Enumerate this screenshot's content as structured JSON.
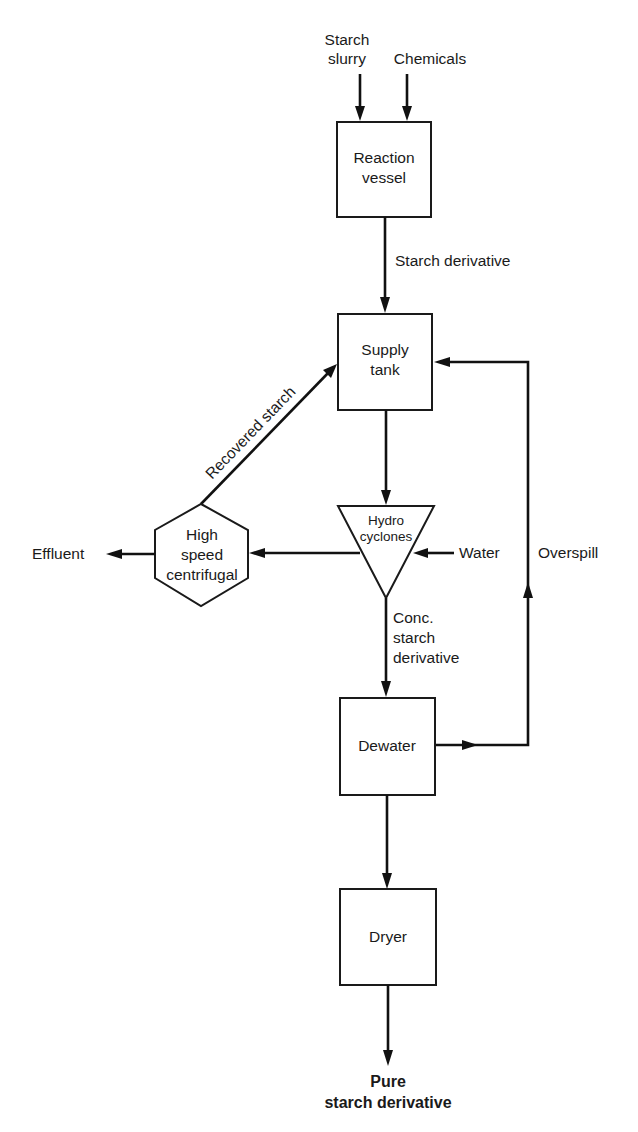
{
  "diagram": {
    "type": "process flow diagram",
    "nodes": {
      "reaction_vessel": {
        "line1": "Reaction",
        "line2": "vessel",
        "shape": "rectangle"
      },
      "supply_tank": {
        "line1": "Supply",
        "line2": "tank",
        "shape": "rectangle"
      },
      "hydrocyclones": {
        "line1": "Hydro",
        "line2": "cyclones",
        "shape": "inverted-triangle"
      },
      "centrifugal": {
        "line1": "High",
        "line2": "speed",
        "line3": "centrifugal",
        "shape": "hexagon"
      },
      "dewater": {
        "label": "Dewater",
        "shape": "rectangle"
      },
      "dryer": {
        "label": "Dryer",
        "shape": "rectangle"
      }
    },
    "inputs": {
      "starch_slurry": {
        "line1": "Starch",
        "line2": "slurry"
      },
      "chemicals": "Chemicals",
      "water": "Water"
    },
    "flows": {
      "starch_derivative": "Starch derivative",
      "recovered_starch": "Recovered starch",
      "conc_line1": "Conc.",
      "conc_line2": "starch",
      "conc_line3": "derivative",
      "overspill": "Overspill",
      "effluent": "Effluent"
    },
    "output": {
      "line1": "Pure",
      "line2": "starch derivative"
    },
    "edges": [
      {
        "from": "Starch slurry",
        "to": "Reaction vessel"
      },
      {
        "from": "Chemicals",
        "to": "Reaction vessel"
      },
      {
        "from": "Reaction vessel",
        "to": "Supply tank",
        "label": "Starch derivative"
      },
      {
        "from": "Supply tank",
        "to": "Hydro cyclones"
      },
      {
        "from": "Water",
        "to": "Hydro cyclones"
      },
      {
        "from": "Hydro cyclones",
        "to": "High speed centrifugal"
      },
      {
        "from": "High speed centrifugal",
        "to": "Supply tank",
        "label": "Recovered starch"
      },
      {
        "from": "High speed centrifugal",
        "to": "Effluent"
      },
      {
        "from": "Hydro cyclones",
        "to": "Dewater",
        "label": "Conc. starch derivative"
      },
      {
        "from": "Dewater",
        "to": "Supply tank",
        "label": "Overspill"
      },
      {
        "from": "Dewater",
        "to": "Dryer"
      },
      {
        "from": "Dryer",
        "to": "Pure starch derivative"
      }
    ]
  }
}
